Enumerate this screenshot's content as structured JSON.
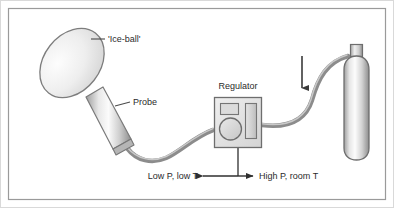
{
  "figure": {
    "type": "cryotherapy-apparatus-diagram",
    "background_color": "#ffffff",
    "frame_color": "#9a9a9a",
    "outline_color": "#6e6e6e",
    "fill_light": "#f2f2f2",
    "fill_mid": "#d8d8d8",
    "fill_dark": "#a9a9a9",
    "text_color": "#2b2b2b"
  },
  "labels": {
    "ice_ball": "'Ice-ball'",
    "probe": "Probe",
    "regulator": "Regulator",
    "low_side": "Low P, low T",
    "high_side": "High P, room T"
  },
  "parts": {
    "ice_ball_name": "ice-ball",
    "probe_name": "probe",
    "tubing_name": "tubing",
    "regulator_name": "regulator",
    "gas_cylinder_name": "gas-cylinder",
    "flow_arrow_name": "gas-flow-arrow",
    "pressure_axis_name": "pressure-temperature-axis"
  }
}
